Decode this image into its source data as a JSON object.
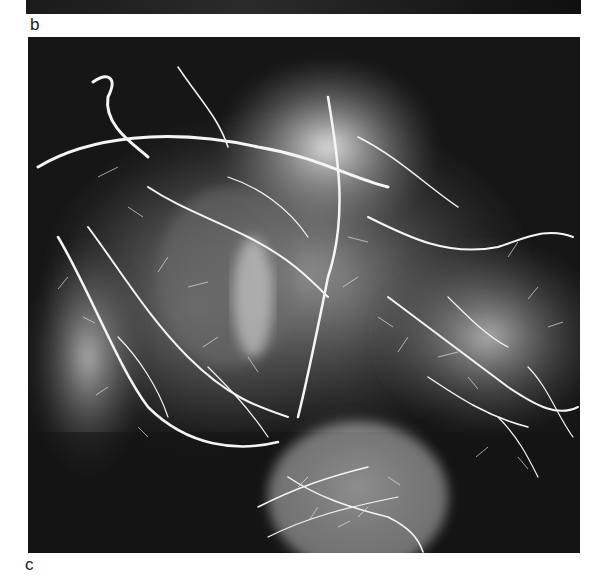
{
  "figure": {
    "panels": [
      {
        "label": "b",
        "description": "Bottom edge of radiograph panel b (cropped, dark strip)"
      },
      {
        "label": "c",
        "description": "Contrast angiogram radiograph showing branching bright vessels over dark background"
      }
    ]
  },
  "colors": {
    "background": "#ffffff",
    "radiograph_dark": "#1a1a1a",
    "vessel": "#f4f4f4",
    "label_text": "#222222"
  }
}
